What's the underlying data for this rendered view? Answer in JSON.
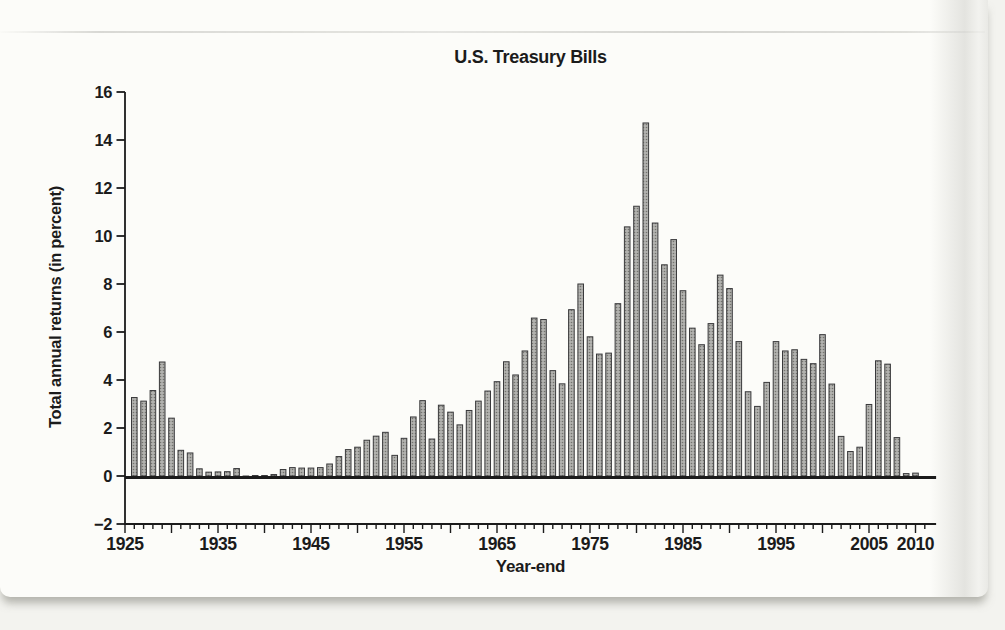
{
  "page": {
    "background": "#f3f3ef",
    "paper_color": "#fcfcf9",
    "shadow_color": "#b5b5ae"
  },
  "chart_data": {
    "type": "bar",
    "title": "U.S. Treasury Bills",
    "xlabel": "Year-end",
    "ylabel": "Total annual returns (in percent)",
    "ylim": [
      -2,
      16
    ],
    "xlim": [
      1925,
      2012
    ],
    "grid": false,
    "legend": "none",
    "axis_color": "#1b1b1b",
    "bar_fill": "#b2b2af",
    "bar_dot": "#74746f",
    "bar_outline": "#39393b",
    "y_tick_values": [
      16,
      14,
      12,
      10,
      8,
      6,
      4,
      2,
      0,
      -2
    ],
    "y_tick_labels": [
      "16",
      "14",
      "12",
      "10",
      "8",
      "6",
      "4",
      "2",
      "0",
      "−2"
    ],
    "x_tick_values": [
      1925,
      1935,
      1945,
      1955,
      1965,
      1975,
      1985,
      1995,
      2005,
      2010
    ],
    "x_tick_labels": [
      "1925",
      "1935",
      "1945",
      "1955",
      "1965",
      "1975",
      "1985",
      "1995",
      "2005",
      "2010"
    ],
    "years": [
      1926,
      1927,
      1928,
      1929,
      1930,
      1931,
      1932,
      1933,
      1934,
      1935,
      1936,
      1937,
      1938,
      1939,
      1940,
      1941,
      1942,
      1943,
      1944,
      1945,
      1946,
      1947,
      1948,
      1949,
      1950,
      1951,
      1952,
      1953,
      1954,
      1955,
      1956,
      1957,
      1958,
      1959,
      1960,
      1961,
      1962,
      1963,
      1964,
      1965,
      1966,
      1967,
      1968,
      1969,
      1970,
      1971,
      1972,
      1973,
      1974,
      1975,
      1976,
      1977,
      1978,
      1979,
      1980,
      1981,
      1982,
      1983,
      1984,
      1985,
      1986,
      1987,
      1988,
      1989,
      1990,
      1991,
      1992,
      1993,
      1994,
      1995,
      1996,
      1997,
      1998,
      1999,
      2000,
      2001,
      2002,
      2003,
      2004,
      2005,
      2006,
      2007,
      2008,
      2009,
      2010
    ],
    "values": [
      3.27,
      3.12,
      3.56,
      4.75,
      2.41,
      1.07,
      0.96,
      0.3,
      0.16,
      0.17,
      0.18,
      0.31,
      -0.02,
      0.02,
      0.0,
      0.06,
      0.27,
      0.35,
      0.33,
      0.33,
      0.35,
      0.5,
      0.81,
      1.1,
      1.2,
      1.49,
      1.66,
      1.82,
      0.86,
      1.57,
      2.46,
      3.14,
      1.54,
      2.95,
      2.66,
      2.13,
      2.73,
      3.12,
      3.54,
      3.93,
      4.76,
      4.21,
      5.21,
      6.58,
      6.52,
      4.39,
      3.84,
      6.93,
      8.0,
      5.8,
      5.08,
      5.12,
      7.18,
      10.38,
      11.24,
      14.71,
      10.54,
      8.8,
      9.85,
      7.72,
      6.16,
      5.47,
      6.35,
      8.37,
      7.81,
      5.6,
      3.51,
      2.9,
      3.9,
      5.6,
      5.21,
      5.26,
      4.86,
      4.68,
      5.89,
      3.83,
      1.65,
      1.02,
      1.2,
      2.98,
      4.8,
      4.66,
      1.6,
      0.1,
      0.12
    ]
  }
}
